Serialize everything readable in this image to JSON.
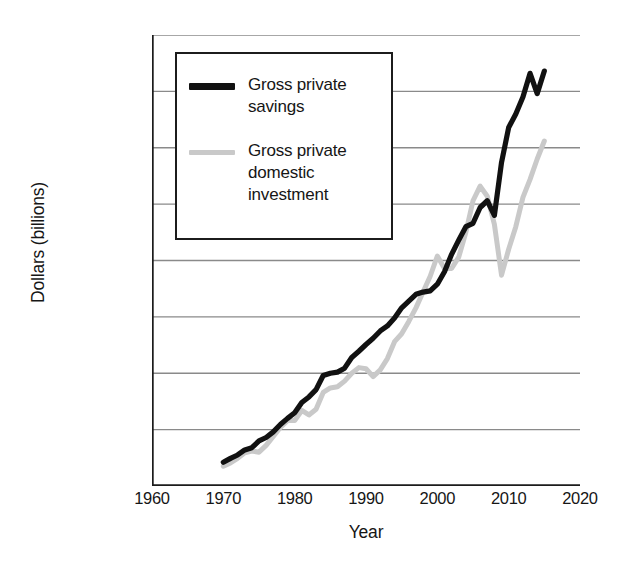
{
  "chart_data": {
    "type": "line",
    "title": "",
    "xlabel": "Year",
    "ylabel": "Dollars (billions)",
    "xlim": [
      1960,
      2020
    ],
    "ylim": [
      0,
      4000
    ],
    "grid": true,
    "legend_position": "upper-left-inside",
    "xticks": [
      "1960",
      "1970",
      "1980",
      "1990",
      "2000",
      "2010",
      "2020"
    ],
    "xtick_values": [
      1960,
      1970,
      1980,
      1990,
      2000,
      2010,
      2020
    ],
    "yticks": [
      "$0.00",
      "$500.00",
      "$1,000.00",
      "$1,500.00",
      "$2,000.00",
      "$2,500.00",
      "$3,000.00",
      "$3,500.00",
      "$4,000.00"
    ],
    "ytick_values": [
      0,
      500,
      1000,
      1500,
      2000,
      2500,
      3000,
      3500,
      4000
    ],
    "colors": {
      "savings": "#111111",
      "investment": "#c9c9c9",
      "grid": "#8a8a8a",
      "axis": "#1c1c1c"
    },
    "x": [
      1970,
      1971,
      1972,
      1973,
      1974,
      1975,
      1976,
      1977,
      1978,
      1979,
      1980,
      1981,
      1982,
      1983,
      1984,
      1985,
      1986,
      1987,
      1988,
      1989,
      1990,
      1991,
      1992,
      1993,
      1994,
      1995,
      1996,
      1997,
      1998,
      1999,
      2000,
      2001,
      2002,
      2003,
      2004,
      2005,
      2006,
      2007,
      2008,
      2009,
      2010,
      2011,
      2012,
      2013,
      2014,
      2015
    ],
    "series": [
      {
        "name": "Gross private savings",
        "color": "#111111",
        "values": [
          210,
          245,
          275,
          320,
          340,
          400,
          430,
          480,
          545,
          600,
          650,
          740,
          790,
          855,
          980,
          1000,
          1010,
          1045,
          1140,
          1195,
          1255,
          1310,
          1375,
          1420,
          1490,
          1580,
          1640,
          1700,
          1720,
          1730,
          1790,
          1900,
          2055,
          2180,
          2300,
          2330,
          2470,
          2530,
          2400,
          2870,
          3180,
          3300,
          3450,
          3660,
          3480,
          3680
        ]
      },
      {
        "name": "Gross private domestic investment",
        "color": "#c9c9c9",
        "values": [
          175,
          205,
          245,
          295,
          310,
          300,
          360,
          440,
          520,
          580,
          580,
          670,
          630,
          680,
          830,
          870,
          880,
          930,
          1000,
          1050,
          1040,
          970,
          1030,
          1130,
          1280,
          1350,
          1460,
          1580,
          1720,
          1860,
          2040,
          1930,
          1930,
          2030,
          2250,
          2530,
          2660,
          2570,
          2320,
          1870,
          2100,
          2300,
          2560,
          2720,
          2900,
          3060
        ]
      }
    ]
  },
  "legend": {
    "entries": [
      {
        "label": "Gross private savings",
        "swatch": "savings-line-swatch"
      },
      {
        "label": "Gross private domestic investment",
        "swatch": "investment-line-swatch"
      }
    ]
  }
}
